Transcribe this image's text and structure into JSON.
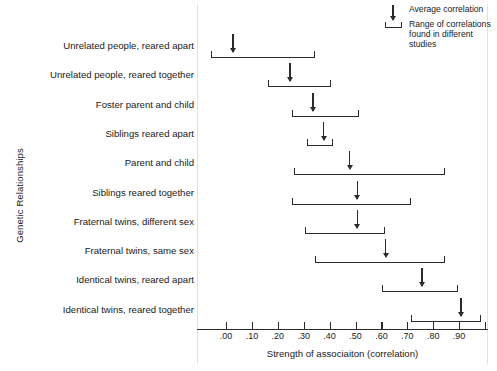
{
  "chart_data": {
    "type": "range",
    "title": "",
    "xlabel": "Strength of associaiton (correlation)",
    "ylabel": "Genetic Relationships",
    "xlim": [
      -0.06,
      1.0
    ],
    "grid": false,
    "xticks": [
      ".00",
      ".10",
      ".20",
      ".30",
      ".40",
      ".50",
      ".60",
      ".70",
      ".80",
      ".90"
    ],
    "xtick_values": [
      0.0,
      0.1,
      0.2,
      0.3,
      0.4,
      0.5,
      0.6,
      0.7,
      0.8,
      0.9
    ],
    "legend_position": "top-right",
    "categories": [
      "Unrelated people, reared apart",
      "Unrelated people, reared together",
      "Foster parent and child",
      "Siblings reared apart",
      "Parent and child",
      "Siblings reared together",
      "Fraternal twins, different sex",
      "Fraternal twins, same sex",
      "Identical twins, reared apart",
      "Identical twins, reared together"
    ],
    "series": [
      {
        "name": "range_low",
        "values": [
          -0.06,
          0.16,
          0.25,
          0.31,
          0.26,
          0.25,
          0.3,
          0.34,
          0.6,
          0.71
        ]
      },
      {
        "name": "average",
        "values": [
          0.02,
          0.24,
          0.33,
          0.37,
          0.47,
          0.5,
          0.5,
          0.61,
          0.75,
          0.9
        ]
      },
      {
        "name": "range_high",
        "values": [
          0.34,
          0.4,
          0.51,
          0.41,
          0.84,
          0.71,
          0.61,
          0.84,
          0.89,
          0.98
        ]
      }
    ],
    "legend": [
      {
        "symbol": "down-arrow",
        "label": "Average correlation"
      },
      {
        "symbol": "bracket",
        "label": "Range of correlations found in different studies"
      }
    ]
  },
  "legend": {
    "average_label": "Average correlation",
    "range_label": "Range of correlations found in different studies"
  },
  "colors": {
    "ink": "#2b2b2b",
    "text": "#1a1a1a",
    "background": "#ffffff",
    "panel_border": "#e2e2e2"
  }
}
